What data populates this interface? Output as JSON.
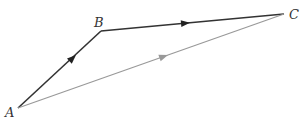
{
  "diagram": {
    "type": "vector-triangle",
    "points": {
      "A": {
        "label": "A",
        "x": 18,
        "y": 108
      },
      "B": {
        "label": "B",
        "x": 101,
        "y": 31
      },
      "C": {
        "label": "C",
        "x": 284,
        "y": 14
      }
    },
    "vectors": [
      {
        "from": "A",
        "to": "B",
        "color": "#333333"
      },
      {
        "from": "B",
        "to": "C",
        "color": "#333333"
      },
      {
        "from": "A",
        "to": "C",
        "color": "#999999"
      }
    ]
  }
}
